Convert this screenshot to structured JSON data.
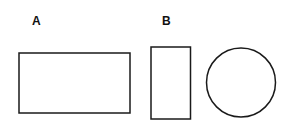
{
  "labels": {
    "a": "A",
    "b": "B"
  },
  "shapes": [
    {
      "id": "rect-a",
      "type": "rectangle",
      "label": "A",
      "x": 19,
      "y": 53,
      "width": 111,
      "height": 60
    },
    {
      "id": "rect-b",
      "type": "rectangle",
      "label": "B",
      "x": 151,
      "y": 47,
      "width": 39.5,
      "height": 72
    },
    {
      "id": "circle",
      "type": "circle",
      "cx": 241,
      "cy": 82.5,
      "r": 34.5
    }
  ],
  "colors": {
    "stroke": "#1a1a1a",
    "background": "#ffffff"
  }
}
